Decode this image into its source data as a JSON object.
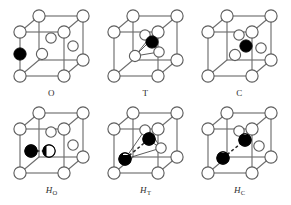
{
  "figure": {
    "background": "#ffffff",
    "line_color": "#6f6f6f",
    "bond_color": "#3a3a3a",
    "atom_fill": "#ffffff",
    "atom_stroke": "#5e5e5e",
    "interstitial_fill": "#000000",
    "rows": 2,
    "cols": 3
  },
  "panels": [
    {
      "id": "panel-O",
      "label_main": "O",
      "label_sub": "",
      "italic": false,
      "site": "octahedral",
      "interstitial_count": 1,
      "interstitial_style": "solid",
      "has_dumbbell": false,
      "has_tetrahedron_edges": false
    },
    {
      "id": "panel-T",
      "label_main": "T",
      "label_sub": "",
      "italic": false,
      "site": "tetrahedral",
      "interstitial_count": 1,
      "interstitial_style": "solid",
      "has_dumbbell": false,
      "has_tetrahedron_edges": true
    },
    {
      "id": "panel-C",
      "label_main": "C",
      "label_sub": "",
      "italic": false,
      "site": "crowdion",
      "interstitial_count": 1,
      "interstitial_style": "solid",
      "has_dumbbell": false,
      "has_tetrahedron_edges": false
    },
    {
      "id": "panel-HO",
      "label_main": "H",
      "label_sub": "O",
      "italic": true,
      "site": "octahedral-split",
      "interstitial_count": 2,
      "interstitial_style": "half",
      "has_dumbbell": true,
      "has_tetrahedron_edges": false
    },
    {
      "id": "panel-HT",
      "label_main": "H",
      "label_sub": "T",
      "italic": true,
      "site": "tetrahedral-split",
      "interstitial_count": 2,
      "interstitial_style": "half",
      "has_dumbbell": true,
      "has_tetrahedron_edges": true
    },
    {
      "id": "panel-HC",
      "label_main": "H",
      "label_sub": "C",
      "italic": true,
      "site": "crowdion-split",
      "interstitial_count": 2,
      "interstitial_style": "half",
      "has_dumbbell": true,
      "has_tetrahedron_edges": false
    }
  ]
}
